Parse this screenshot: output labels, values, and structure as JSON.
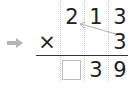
{
  "problem": {
    "operator": "×",
    "multiplicand": [
      "2",
      "1",
      "3"
    ],
    "multiplier": [
      "",
      "",
      "3"
    ],
    "result": [
      "",
      "3",
      "9"
    ],
    "answer_box": ""
  },
  "colors": {
    "arrow": "#b5b5b5",
    "grid": "#c8c8c8",
    "text": "#222222"
  },
  "icons": {
    "pointer": "right-arrow-icon",
    "carry_link": "diagonal-arrow-icon"
  }
}
